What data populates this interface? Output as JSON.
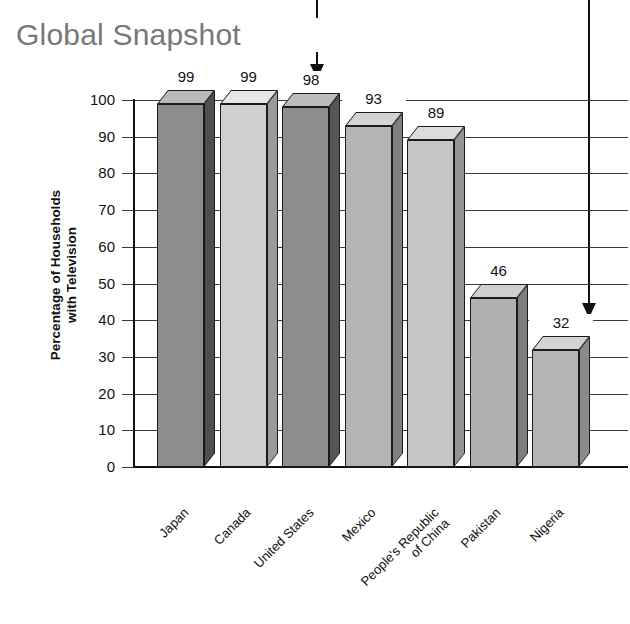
{
  "title": "Global Snapshot",
  "title_color": "#76787a",
  "axis": {
    "y_label_line1": "Percentage of Households",
    "y_label_line2": "with Television",
    "y_ticks": [
      "100",
      "90",
      "80",
      "70",
      "60",
      "50",
      "40",
      "30",
      "20",
      "10",
      "0"
    ]
  },
  "annotations": [
    {
      "name": "callout-arrow-united-states",
      "target": "United States"
    },
    {
      "name": "callout-arrow-nigeria",
      "target": "Nigeria"
    }
  ],
  "chart_data": {
    "type": "bar",
    "title": "Global Snapshot",
    "xlabel": "",
    "ylabel": "Percentage of Households with Television",
    "ylim": [
      0,
      100
    ],
    "ytick_step": 10,
    "grid": true,
    "legend": "none",
    "style": "3d-bars",
    "categories": [
      "Japan",
      "Canada",
      "United States",
      "Mexico",
      "People's Republic of China",
      "Pakistan",
      "Nigeria"
    ],
    "category_lines": [
      [
        "Japan"
      ],
      [
        "Canada"
      ],
      [
        "United States"
      ],
      [
        "Mexico"
      ],
      [
        "People's Republic",
        "of China"
      ],
      [
        "Pakistan"
      ],
      [
        "Nigeria"
      ]
    ],
    "values": [
      99,
      99,
      98,
      93,
      89,
      46,
      32
    ],
    "value_labels": [
      "99",
      "99",
      "98",
      "93",
      "89",
      "46",
      "32"
    ],
    "bar_colors": [
      "#8d8d8d",
      "#cfcfcf",
      "#8d8d8d",
      "#b4b4b4",
      "#c6c6c6",
      "#b0b0b0",
      "#b4b4b4"
    ],
    "bar_side_colors": [
      "#4f4f4f",
      "#9b9b9b",
      "#555555",
      "#808080",
      "#949494",
      "#7d7d7d",
      "#8a8a8a"
    ],
    "bar_top_colors": [
      "#b9b9b9",
      "#e6e6e6",
      "#bcbcbc",
      "#d4d4d4",
      "#dcdcdc",
      "#d0d0d0",
      "#d4d4d4"
    ]
  }
}
